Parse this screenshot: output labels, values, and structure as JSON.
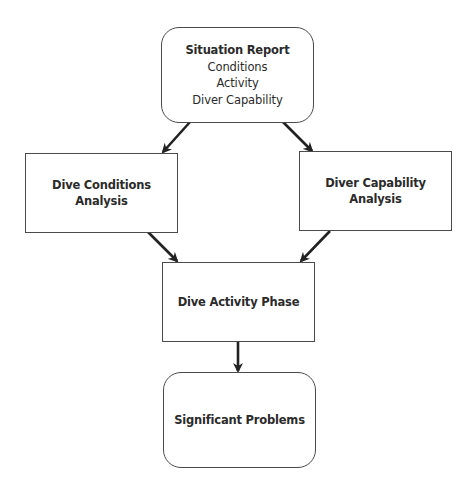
{
  "diagram": {
    "nodes": [
      {
        "id": "situation-report",
        "shape": "rounded-rect",
        "title": "Situation Report",
        "lines": [
          "Conditions",
          "Activity",
          "Diver Capability"
        ]
      },
      {
        "id": "dive-conditions-analysis",
        "shape": "rect",
        "title_line1": "Dive Conditions",
        "title_line2": "Analysis"
      },
      {
        "id": "diver-capability-analysis",
        "shape": "rect",
        "title_line1": "Diver Capability",
        "title_line2": "Analysis"
      },
      {
        "id": "dive-activity-phase",
        "shape": "rect",
        "title": "Dive Activity Phase"
      },
      {
        "id": "significant-problems",
        "shape": "rounded-rect",
        "title": "Significant Problems"
      }
    ],
    "edges": [
      {
        "from": "situation-report",
        "to": "dive-conditions-analysis"
      },
      {
        "from": "situation-report",
        "to": "diver-capability-analysis"
      },
      {
        "from": "dive-conditions-analysis",
        "to": "dive-activity-phase"
      },
      {
        "from": "diver-capability-analysis",
        "to": "dive-activity-phase"
      },
      {
        "from": "dive-activity-phase",
        "to": "significant-problems"
      }
    ],
    "colors": {
      "stroke": "#4a4a4a",
      "arrow": "#222222",
      "text": "#2b2b2b",
      "background": "#ffffff"
    }
  }
}
